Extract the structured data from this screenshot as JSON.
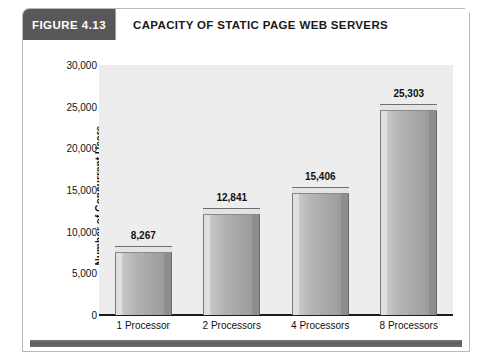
{
  "figure": {
    "number_label": "FIGURE 4.13",
    "title": "CAPACITY OF STATIC PAGE WEB SERVERS",
    "badge_color": "#58585a",
    "card_border_color": "#b9b9b9",
    "footer_rule_color": "#5c5c60"
  },
  "chart_data": {
    "type": "bar",
    "title": "CAPACITY OF STATIC PAGE WEB SERVERS",
    "subtitle": "",
    "xlabel": "",
    "ylabel": "Number of Concurrent Users",
    "categories": [
      "1 Processor",
      "2 Processors",
      "4 Processors",
      "8 Processors"
    ],
    "values": [
      8267,
      12841,
      15406,
      25303
    ],
    "value_labels": [
      "8,267",
      "12,841",
      "15,406",
      "25,303"
    ],
    "ylim": [
      0,
      30000
    ],
    "ytick_values": [
      0,
      5000,
      10000,
      15000,
      20000,
      25000,
      30000
    ],
    "ytick_labels": [
      "0",
      "5,000",
      "10,000",
      "15,000",
      "20,000",
      "25,000",
      "30,000"
    ],
    "grid": false,
    "legend": false,
    "legend_position": "none",
    "plot_background": "#ededed",
    "bar_color": "#b4b4b4",
    "bar_style": "3d-extruded"
  }
}
